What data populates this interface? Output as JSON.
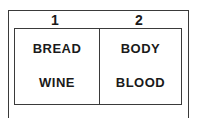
{
  "columns": [
    {
      "number": "1",
      "items": [
        "BREAD",
        "WINE"
      ]
    },
    {
      "number": "2",
      "items": [
        "BODY",
        "BLOOD"
      ]
    }
  ]
}
